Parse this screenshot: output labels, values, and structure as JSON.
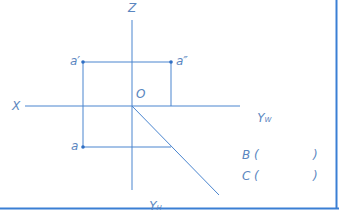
{
  "diagram": {
    "type": "orthographic-projection",
    "colors": {
      "line": "#3d7bd0",
      "text": "#5a86c0",
      "border": "#3a7fd4"
    },
    "axes": {
      "z_label": "Z",
      "x_label": "X",
      "origin_label": "O",
      "yw_label": "Y",
      "yw_sub": "W",
      "yh_label": "Y",
      "yh_sub": "H"
    },
    "points": {
      "a_prime": {
        "label": "a′",
        "x": 83,
        "y": 62
      },
      "a_double_prime": {
        "label": "a″",
        "x": 171,
        "y": 62
      },
      "a": {
        "label": "a",
        "x": 83,
        "y": 147
      }
    },
    "answers": {
      "b_label": "B",
      "b_open": "(",
      "b_close": ")",
      "c_label": "C",
      "c_open": "(",
      "c_close": ")"
    }
  }
}
